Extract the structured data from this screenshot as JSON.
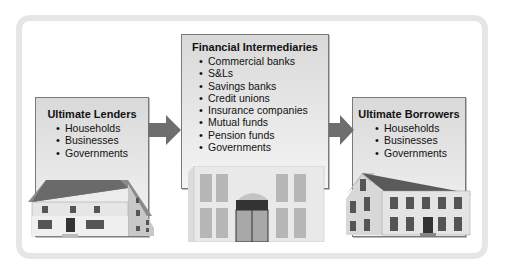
{
  "diagram": {
    "type": "flow",
    "nodes": [
      {
        "id": "lenders",
        "title": "Ultimate Lenders",
        "items": [
          "Households",
          "Businesses",
          "Governments"
        ],
        "image": "house-icon"
      },
      {
        "id": "intermediaries",
        "title": "Financial Intermediaries",
        "items": [
          "Commercial banks",
          "S&Ls",
          "Savings banks",
          "Credit unions",
          "Insurance companies",
          "Mutual funds",
          "Pension funds",
          "Governments"
        ],
        "image": "bank-building-icon"
      },
      {
        "id": "borrowers",
        "title": "Ultimate Borrowers",
        "items": [
          "Households",
          "Businesses",
          "Governments"
        ],
        "image": "house-icon"
      }
    ],
    "edges": [
      {
        "from": "lenders",
        "to": "intermediaries"
      },
      {
        "from": "intermediaries",
        "to": "borrowers"
      }
    ]
  },
  "colors": {
    "box_fill": "#e4e4e4",
    "box_border": "#7a7a7a",
    "arrow": "#6e6e6e",
    "frame": "#e6e6e6"
  }
}
